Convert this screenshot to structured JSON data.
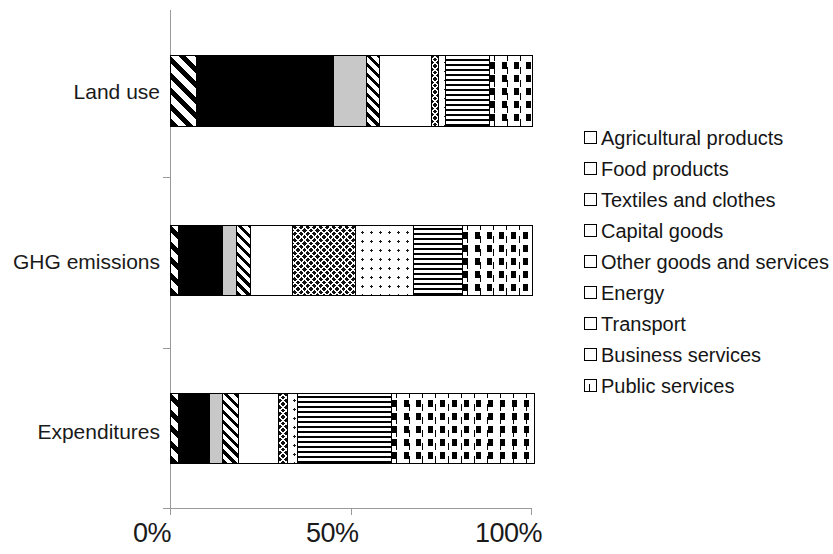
{
  "chart_data": {
    "type": "bar",
    "orientation": "horizontal",
    "stacked": true,
    "normalized": true,
    "title": "",
    "xlabel": "",
    "ylabel": "",
    "xlim": [
      0,
      100
    ],
    "x_tick_labels": [
      "0%",
      "50%",
      "100%"
    ],
    "x_tick_values": [
      0,
      50,
      100
    ],
    "grid": false,
    "legend_position": "right",
    "categories": [
      "Land use",
      "GHG emissions",
      "Expenditures"
    ],
    "series": [
      {
        "name": "Agricultural products",
        "pattern": "diagonal-hatch-thick",
        "values": [
          7.0,
          2.0,
          2.0
        ]
      },
      {
        "name": "Food products",
        "pattern": "solid-black",
        "values": [
          38.0,
          12.0,
          8.5
        ]
      },
      {
        "name": "Textiles and clothes",
        "pattern": "solid-light-gray",
        "values": [
          9.0,
          4.0,
          3.5
        ]
      },
      {
        "name": "Capital goods",
        "pattern": "diagonal-hatch-fine",
        "values": [
          3.5,
          4.0,
          4.5
        ]
      },
      {
        "name": "Other goods and services",
        "pattern": "solid-white",
        "values": [
          14.5,
          11.5,
          11.0
        ]
      },
      {
        "name": "Energy",
        "pattern": "dark-checkerboard",
        "values": [
          2.0,
          17.5,
          2.5
        ]
      },
      {
        "name": "Transport",
        "pattern": "small-dots",
        "values": [
          2.0,
          16.0,
          3.0
        ]
      },
      {
        "name": "Business services",
        "pattern": "horizontal-lines",
        "values": [
          12.0,
          13.5,
          26.0
        ]
      },
      {
        "name": "Public services",
        "pattern": "vertical-dashed-lines",
        "values": [
          12.0,
          19.5,
          39.5
        ]
      }
    ],
    "colors": {
      "axis": "#9a9a9a",
      "outline": "#000000",
      "text": "#1a1a1a",
      "food_products": "#000000",
      "textiles_and_clothes": "#c8c8c8",
      "other_goods_and_services": "#ffffff"
    }
  },
  "legend": {
    "items": [
      {
        "label": "Agricultural products",
        "key": "agri-pattern-swatch"
      },
      {
        "label": "Food products",
        "key": "food-pattern-swatch"
      },
      {
        "label": "Textiles and clothes",
        "key": "textiles-pattern-swatch"
      },
      {
        "label": "Capital goods",
        "key": "capital-pattern-swatch"
      },
      {
        "label": "Other goods and services",
        "key": "other-pattern-swatch"
      },
      {
        "label": "Energy",
        "key": "energy-pattern-swatch"
      },
      {
        "label": "Transport",
        "key": "transport-pattern-swatch"
      },
      {
        "label": "Business services",
        "key": "business-pattern-swatch"
      },
      {
        "label": "Public services",
        "key": "public-pattern-swatch"
      }
    ]
  }
}
